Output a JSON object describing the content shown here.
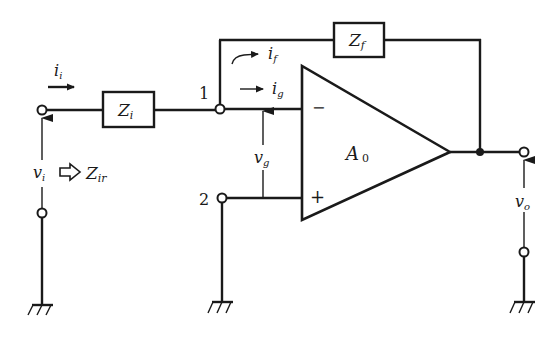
{
  "diagram": {
    "type": "inverting operational amplifier circuit",
    "components": {
      "input_impedance": {
        "label": "Z",
        "sub": "i"
      },
      "feedback_impedance": {
        "label": "Z",
        "sub": "f"
      },
      "opamp": {
        "label": "A",
        "sub": "0",
        "inverting_sign": "−",
        "noninverting_sign": "+"
      }
    },
    "nodes": {
      "node1": "1",
      "node2": "2"
    },
    "currents": {
      "input": {
        "label": "i",
        "sub": "i"
      },
      "feedback": {
        "label": "i",
        "sub": "f"
      },
      "opamp_input": {
        "label": "i",
        "sub": "g"
      }
    },
    "voltages": {
      "input": {
        "label": "v",
        "sub": "i"
      },
      "differential": {
        "label": "v",
        "sub": "g"
      },
      "output": {
        "label": "v",
        "sub": "o"
      }
    },
    "input_impedance_annotation": {
      "label": "Z",
      "sub": "ir",
      "arrow": "⇨"
    }
  }
}
